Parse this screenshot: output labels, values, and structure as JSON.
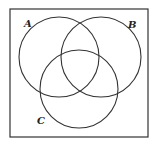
{
  "diagram": {
    "type": "venn",
    "frame": {
      "x": 10,
      "y": 9,
      "width": 138,
      "height": 128,
      "stroke": "#333333"
    },
    "sets": [
      {
        "label": "A",
        "cx": 59,
        "cy": 57,
        "r": 40,
        "label_x": 24,
        "label_y": 27
      },
      {
        "label": "B",
        "cx": 101,
        "cy": 57,
        "r": 40,
        "label_x": 128,
        "label_y": 28
      },
      {
        "label": "C",
        "cx": 79,
        "cy": 89,
        "r": 39,
        "label_x": 37,
        "label_y": 124
      }
    ],
    "stroke_color": "#333333"
  }
}
